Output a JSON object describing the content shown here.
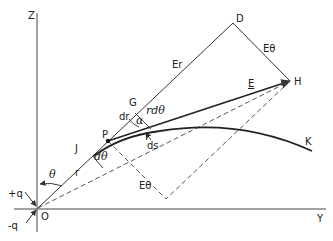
{
  "diagram": {
    "axes": {
      "z_label": "Z",
      "y_label": "Y",
      "origin_label": "O"
    },
    "charges": {
      "positive": "+q",
      "negative": "-q"
    },
    "points": {
      "P": "P",
      "G": "G",
      "D": "D",
      "H": "H",
      "F": "F",
      "J": "J",
      "K": "K"
    },
    "labels": {
      "theta": "θ",
      "r": "r",
      "d_theta": "dθ",
      "dr": "dr",
      "r_d_theta": "rdθ",
      "alpha": "α",
      "ds": "ds",
      "E_r": "Er",
      "E_theta_top": "Eθ",
      "E_theta_bottom": "Eθ",
      "E": "E"
    },
    "colors": {
      "line": "#333333",
      "background": "#ffffff"
    }
  }
}
